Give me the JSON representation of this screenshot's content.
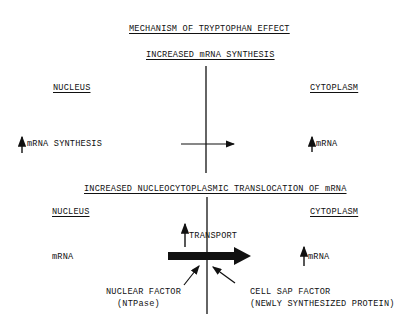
{
  "title": "MECHANISM OF TRYPTOPHAN EFFECT",
  "section1": {
    "heading": "INCREASED mRNA SYNTHESIS",
    "left_label": "NUCLEUS",
    "right_label": "CYTOPLASM",
    "left_item": "mRNA SYNTHESIS",
    "right_item": "mRNA",
    "left_item_icon": "up-arrow-icon",
    "right_item_icon": "up-arrow-icon"
  },
  "section2": {
    "heading": "INCREASED NUCLEOCYTOPLASMIC TRANSLOCATION OF mRNA",
    "left_label": "NUCLEUS",
    "right_label": "CYTOPLASM",
    "left_item": "mRNA",
    "right_item": "mRNA",
    "transport_label": "TRANSPORT",
    "nuclear_factor": "NUCLEAR FACTOR",
    "nuclear_factor_sub": "(NTPase)",
    "cell_sap_factor": "CELL SAP FACTOR",
    "cell_sap_factor_sub": "(NEWLY SYNTHESIZED PROTEIN)"
  }
}
